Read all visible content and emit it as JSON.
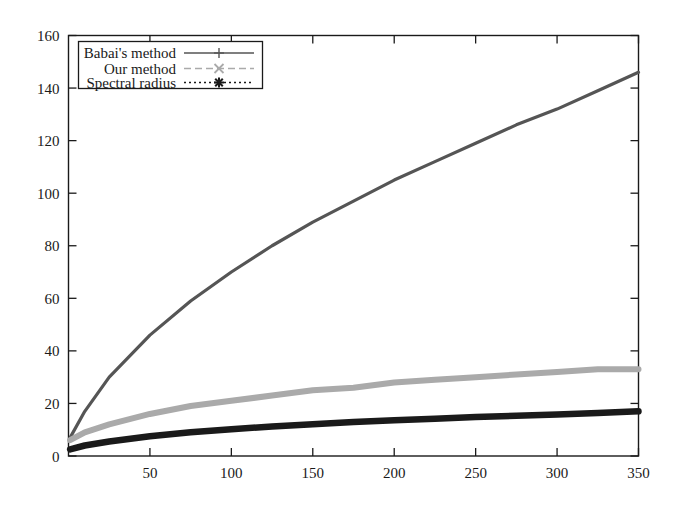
{
  "chart_data": {
    "type": "line",
    "title": "",
    "xlabel": "",
    "ylabel": "",
    "xlim": [
      0,
      350
    ],
    "ylim": [
      0,
      160
    ],
    "grid": false,
    "legend_position": "top-left",
    "xticks": [
      50,
      100,
      150,
      200,
      250,
      300,
      350
    ],
    "yticks": [
      0,
      20,
      40,
      60,
      80,
      100,
      120,
      140,
      160
    ],
    "x": [
      1,
      10,
      25,
      50,
      75,
      100,
      125,
      150,
      175,
      200,
      225,
      250,
      275,
      300,
      325,
      350
    ],
    "series": [
      {
        "name": "Babai's method",
        "color": "#555555",
        "linestyle": "solid",
        "marker": "plus",
        "values": [
          7,
          17,
          30,
          46,
          59,
          70,
          80,
          89,
          97,
          105,
          112,
          119,
          126,
          132,
          139,
          146
        ]
      },
      {
        "name": "Our method",
        "color": "#aaaaaa",
        "linestyle": "dashed",
        "marker": "cross",
        "values": [
          6,
          9,
          12,
          16,
          19,
          21,
          23,
          25,
          26,
          28,
          29,
          30,
          31,
          32,
          33,
          33
        ]
      },
      {
        "name": "Spectral radius",
        "color": "#1a1a1a",
        "linestyle": "dotted",
        "marker": "star",
        "values": [
          2.5,
          4,
          5.5,
          7.5,
          9,
          10.2,
          11.2,
          12.1,
          12.9,
          13.6,
          14.2,
          14.8,
          15.3,
          15.8,
          16.4,
          17
        ]
      }
    ]
  },
  "axes": {
    "ytick_labels": [
      "160",
      "140",
      "120",
      "100",
      "80",
      "60",
      "40",
      "20",
      "0"
    ],
    "xtick_labels": [
      "50",
      "100",
      "150",
      "200",
      "250",
      "300",
      "350"
    ]
  },
  "legend": {
    "entries": [
      {
        "label": "Babai's method"
      },
      {
        "label": "Our method"
      },
      {
        "label": "Spectral radius"
      }
    ]
  }
}
